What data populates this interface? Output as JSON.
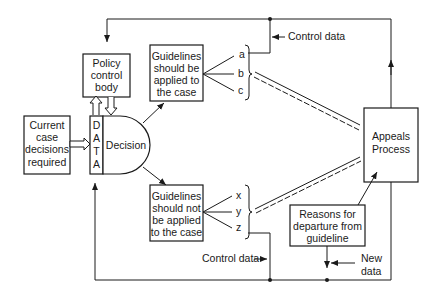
{
  "diagram": {
    "boxes": {
      "policy_control_body": [
        "Policy",
        "control",
        "body"
      ],
      "current_case": [
        "Current",
        "case",
        "decisions",
        "required"
      ],
      "data_column": [
        "D",
        "A",
        "T",
        "A"
      ],
      "decision": "Decision",
      "guidelines_applied": [
        "Guidelines",
        "should be",
        "applied to",
        "the case"
      ],
      "guidelines_not_applied": [
        "Guidelines",
        "should not",
        "be applied",
        "to the case"
      ],
      "appeals_process": [
        "Appeals",
        "Process"
      ],
      "reasons_departure": [
        "Reasons for",
        "departure from",
        "guideline"
      ]
    },
    "branches_top": [
      "a",
      "b",
      "c"
    ],
    "branches_bottom": [
      "x",
      "y",
      "z"
    ],
    "labels": {
      "control_data_top": "Control data",
      "control_data_bottom": "Control data",
      "new_data": [
        "New",
        "data"
      ]
    }
  }
}
